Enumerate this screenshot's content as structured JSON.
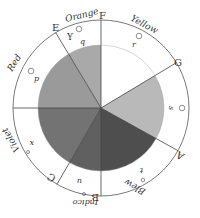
{
  "diagram": {
    "center": [
      101,
      108
    ],
    "pie_radius": 63,
    "outer_radius": 88,
    "divider_points": [
      {
        "letter": "F",
        "angle": -90
      },
      {
        "letter": "G",
        "angle": -31
      },
      {
        "letter": "A",
        "angle": 29
      },
      {
        "letter": "B",
        "angle": 90
      },
      {
        "letter": "C",
        "angle": 120
      },
      {
        "letter": "D",
        "angle": 180
      },
      {
        "letter": "E",
        "angle": -121
      }
    ],
    "segments": [
      {
        "color": "Yellow",
        "from": -90,
        "to": -31,
        "fill": "#ffffff",
        "center_letter": "r"
      },
      {
        "color": "Green",
        "from": -31,
        "to": 29,
        "fill": "#b9b9b9",
        "center_letter": "s"
      },
      {
        "color": "Blew",
        "from": 29,
        "to": 90,
        "fill": "#4e4e4e",
        "center_letter": "t"
      },
      {
        "color": "Indico",
        "from": 90,
        "to": 120,
        "fill": "#606060",
        "center_letter": "u"
      },
      {
        "color": "Violet",
        "from": 120,
        "to": 180,
        "fill": "#737373",
        "center_letter": "x"
      },
      {
        "color": "Red",
        "from": 180,
        "to": 239,
        "fill": "#9a9a9a",
        "center_letter": "p"
      },
      {
        "color": "Orange",
        "from": 239,
        "to": 270,
        "fill": "#a9a9a9",
        "center_letter": "q"
      }
    ],
    "labels": {
      "orange": "Orange",
      "yellow": "Yellow",
      "red": "Red",
      "violet": "Violet",
      "indico": "Indico",
      "blew": "Blew",
      "letter_E": "E",
      "letter_F": "F",
      "letter_G": "G",
      "letter_A": "A",
      "letter_B": "B",
      "letter_C": "C",
      "letter_D": "D",
      "letter_Y": "Y",
      "p": "p",
      "q": "q",
      "r": "r",
      "s": "s",
      "t": "t",
      "u": "u",
      "x": "x"
    }
  }
}
